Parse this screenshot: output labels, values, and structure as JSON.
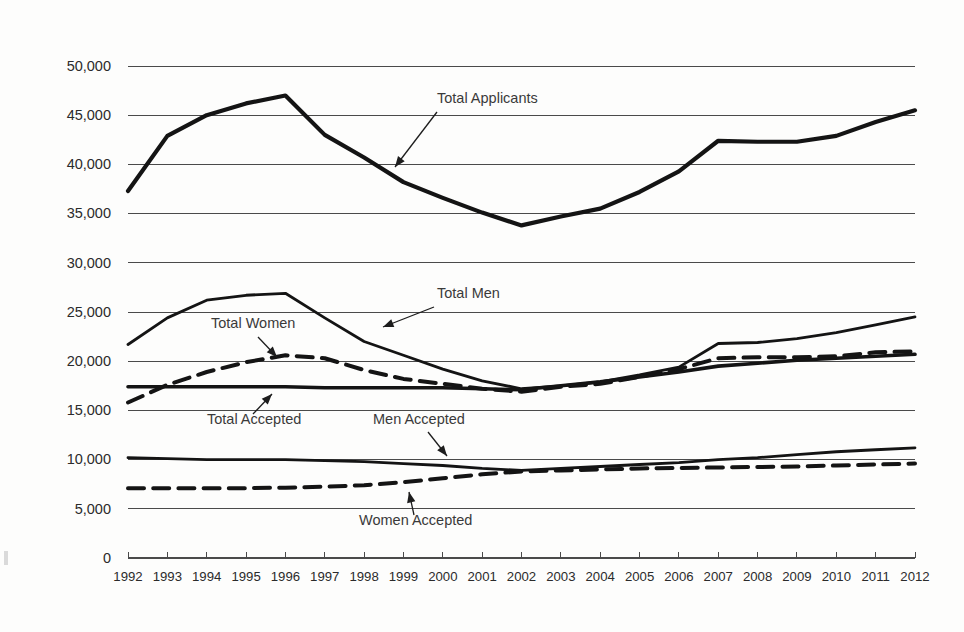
{
  "chart_data": {
    "type": "line",
    "title": "",
    "xlabel": "",
    "ylabel": "",
    "grid": true,
    "legend_position": "inline-annotations",
    "xlim": [
      1992,
      2012
    ],
    "ylim": [
      0,
      50000
    ],
    "categories": [
      1992,
      1993,
      1994,
      1995,
      1996,
      1997,
      1998,
      1999,
      2000,
      2001,
      2002,
      2003,
      2004,
      2005,
      2006,
      2007,
      2008,
      2009,
      2010,
      2011,
      2012
    ],
    "x_tick_labels": [
      "1992",
      "1993",
      "1994",
      "1995",
      "1996",
      "1997",
      "1998",
      "1999",
      "2000",
      "2001",
      "2002",
      "2003",
      "2004",
      "2005",
      "2006",
      "2007",
      "2008",
      "2009",
      "2010",
      "2011",
      "2012"
    ],
    "y_tick_values": [
      0,
      5000,
      10000,
      15000,
      20000,
      25000,
      30000,
      35000,
      40000,
      45000,
      50000
    ],
    "y_tick_labels": [
      "0",
      "5,000",
      "10,000",
      "15,000",
      "20,000",
      "25,000",
      "30,000",
      "35,000",
      "40,000",
      "45,000",
      "50,000"
    ],
    "series": [
      {
        "name": "Total Applicants",
        "style": "solid",
        "width": 4.2,
        "color": "#141414",
        "values": [
          37300,
          42900,
          45000,
          46200,
          47000,
          43000,
          40700,
          38200,
          36600,
          35100,
          33800,
          34700,
          35500,
          37200,
          39300,
          42400,
          42300,
          42300,
          42900,
          44300,
          45500
        ]
      },
      {
        "name": "Total Men",
        "style": "solid",
        "width": 2.8,
        "color": "#141414",
        "values": [
          21700,
          24400,
          26200,
          26700,
          26900,
          24400,
          22000,
          20600,
          19200,
          18000,
          17200,
          17500,
          17900,
          18600,
          19400,
          21800,
          21900,
          22300,
          22900,
          23700,
          24500
        ]
      },
      {
        "name": "Total Women",
        "style": "dashed",
        "width": 4.0,
        "color": "#141414",
        "values": [
          15800,
          17600,
          18900,
          19900,
          20600,
          20300,
          19100,
          18200,
          17700,
          17200,
          16900,
          17400,
          17700,
          18400,
          19200,
          20300,
          20400,
          20400,
          20500,
          20900,
          21000
        ]
      },
      {
        "name": "Total Accepted",
        "style": "solid",
        "width": 3.6,
        "color": "#141414",
        "values": [
          17400,
          17400,
          17400,
          17400,
          17400,
          17300,
          17300,
          17300,
          17300,
          17200,
          17100,
          17500,
          17900,
          18400,
          18900,
          19500,
          19800,
          20100,
          20300,
          20500,
          20700
        ]
      },
      {
        "name": "Men Accepted",
        "style": "solid",
        "width": 2.8,
        "color": "#141414",
        "values": [
          10200,
          10100,
          10000,
          10000,
          10000,
          9900,
          9800,
          9600,
          9400,
          9100,
          8900,
          9100,
          9300,
          9500,
          9700,
          10000,
          10200,
          10500,
          10800,
          11000,
          11200
        ]
      },
      {
        "name": "Women Accepted",
        "style": "dashed",
        "width": 4.0,
        "color": "#141414",
        "values": [
          7100,
          7100,
          7100,
          7100,
          7150,
          7250,
          7400,
          7700,
          8100,
          8500,
          8800,
          8900,
          9000,
          9100,
          9150,
          9200,
          9250,
          9300,
          9400,
          9500,
          9600
        ]
      }
    ],
    "annotations": [
      {
        "text": "Total Applicants",
        "label_x": 437,
        "label_y": 103,
        "arrow_from_x": 437,
        "arrow_from_y": 112,
        "arrow_to_x": 395,
        "arrow_to_y": 167
      },
      {
        "text": "Total Men",
        "label_x": 437,
        "label_y": 298,
        "arrow_from_x": 434,
        "arrow_from_y": 307,
        "arrow_to_x": 383,
        "arrow_to_y": 327
      },
      {
        "text": "Total Women",
        "label_x": 211,
        "label_y": 328,
        "arrow_from_x": 258,
        "arrow_from_y": 337,
        "arrow_to_x": 277,
        "arrow_to_y": 357
      },
      {
        "text": "Total Accepted",
        "label_x": 207,
        "label_y": 424,
        "arrow_from_x": 253,
        "arrow_from_y": 414,
        "arrow_to_x": 272,
        "arrow_to_y": 394
      },
      {
        "text": "Men Accepted",
        "label_x": 373,
        "label_y": 424,
        "arrow_from_x": 428,
        "arrow_from_y": 432,
        "arrow_to_x": 447,
        "arrow_to_y": 456
      },
      {
        "text": "Women Accepted",
        "label_x": 359,
        "label_y": 525,
        "arrow_from_x": 414,
        "arrow_from_y": 515,
        "arrow_to_x": 409,
        "arrow_to_y": 492
      }
    ]
  }
}
